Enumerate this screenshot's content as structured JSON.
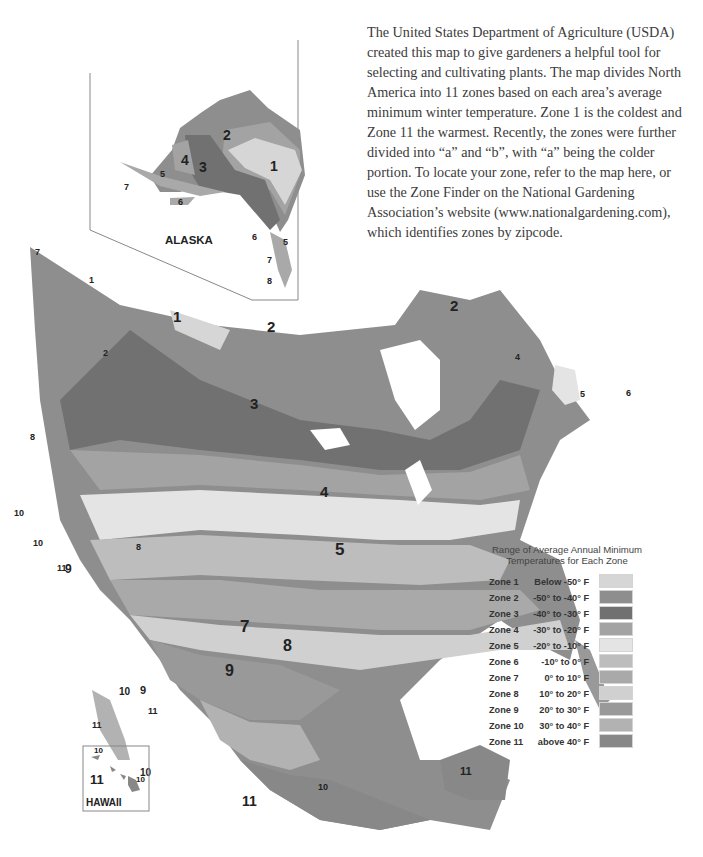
{
  "intro": {
    "text": "The United States Department of Agriculture (USDA) created this map to give gardeners a helpful tool for selecting and cultivating plants. The map divides North America into 11 zones based on each area’s average minimum winter temperature. Zone 1 is the coldest and Zone 11 the warmest. Recently, the zones were further divided into “a” and “b”, with “a” being the colder portion. To locate your zone, refer to the map here, or use the Zone Finder on the National Gardening Association’s website (www.nationalgardening.com), which identifies zones by zipcode."
  },
  "insets": {
    "alaska": {
      "label": "ALASKA"
    },
    "hawaii": {
      "label": "HAWAII"
    }
  },
  "legend": {
    "title_line1": "Range of Average Annual Minimum",
    "title_line2": "Temperatures for Each Zone",
    "zones": [
      {
        "zone": "Zone 1",
        "range": "Below -50° F",
        "color": "#d6d6d6"
      },
      {
        "zone": "Zone 2",
        "range": "-50° to -40° F",
        "color": "#8e8e8e"
      },
      {
        "zone": "Zone 3",
        "range": "-40° to -30° F",
        "color": "#717171"
      },
      {
        "zone": "Zone 4",
        "range": "-30° to -20° F",
        "color": "#a3a3a3"
      },
      {
        "zone": "Zone 5",
        "range": "-20° to -10° F",
        "color": "#e4e4e4"
      },
      {
        "zone": "Zone 6",
        "range": "-10° to 0° F",
        "color": "#bdbdbd"
      },
      {
        "zone": "Zone 7",
        "range": "0° to 10° F",
        "color": "#a9a9a9"
      },
      {
        "zone": "Zone 8",
        "range": "10° to 20° F",
        "color": "#d0d0d0"
      },
      {
        "zone": "Zone 9",
        "range": "20° to 30° F",
        "color": "#999999"
      },
      {
        "zone": "Zone 10",
        "range": "30° to 40° F",
        "color": "#b2b2b2"
      },
      {
        "zone": "Zone 11",
        "range": "above 40° F",
        "color": "#888888"
      }
    ]
  },
  "map_labels": {
    "alaska": [
      "1",
      "2",
      "3",
      "4",
      "5",
      "5",
      "6",
      "6",
      "7",
      "7",
      "8"
    ],
    "canada": [
      "1",
      "1",
      "2",
      "2",
      "2",
      "3",
      "3",
      "3",
      "3",
      "4",
      "5",
      "6"
    ],
    "usa": [
      "4",
      "5",
      "6",
      "7",
      "8",
      "9",
      "10",
      "11"
    ],
    "mexico": [
      "9",
      "10",
      "11"
    ],
    "hawaii": [
      "10",
      "10",
      "11"
    ]
  }
}
